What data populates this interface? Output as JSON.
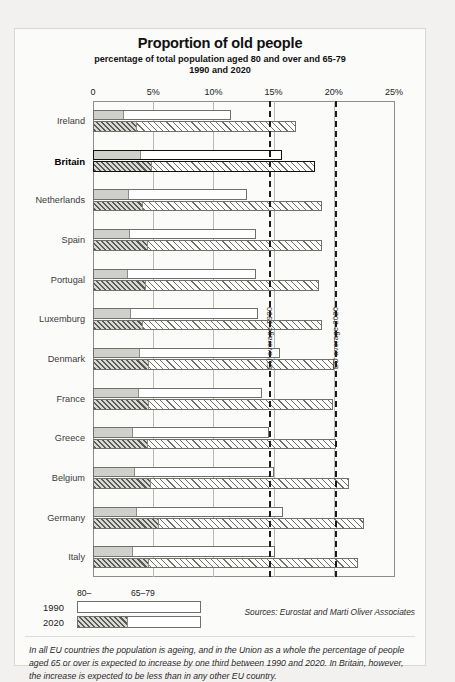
{
  "chart_data": {
    "type": "bar",
    "title": "Proportion of old people",
    "subtitle1": "percentage of total population aged 80 and over and 65-79",
    "subtitle2": "1990 and 2020",
    "xlabel": "",
    "ylabel": "",
    "xlim": [
      0,
      25
    ],
    "grid": true,
    "orientation": "horizontal",
    "stacked": true,
    "legend_position": "bottom-left",
    "axis_ticks": [
      "0",
      "5%",
      "10%",
      "15%",
      "20%",
      "25%"
    ],
    "axis_tick_values": [
      0,
      5,
      10,
      15,
      20,
      25
    ],
    "segment_names": [
      "80–",
      "65–79"
    ],
    "series": [
      {
        "name": "1990",
        "style": "solid"
      },
      {
        "name": "2020",
        "style": "hatched"
      }
    ],
    "annotations": [
      {
        "label": "EU average 1990",
        "value": 14.6
      },
      {
        "label": "EU average 2020",
        "value": 20.1
      }
    ],
    "categories": [
      "Ireland",
      "Britain",
      "Netherlands",
      "Spain",
      "Portugal",
      "Luxemburg",
      "Denmark",
      "France",
      "Greece",
      "Belgium",
      "Germany",
      "Italy"
    ],
    "highlight_category": "Britain",
    "rows": [
      {
        "country": "Ireland",
        "y1990_80plus": 2.5,
        "y1990_total": 11.5,
        "y2020_80plus": 3.6,
        "y2020_total": 16.9
      },
      {
        "country": "Britain",
        "y1990_80plus": 3.9,
        "y1990_total": 15.7,
        "y2020_80plus": 4.8,
        "y2020_total": 18.4
      },
      {
        "country": "Netherlands",
        "y1990_80plus": 2.9,
        "y1990_total": 12.8,
        "y2020_80plus": 4.1,
        "y2020_total": 19.0
      },
      {
        "country": "Spain",
        "y1990_80plus": 3.0,
        "y1990_total": 13.5,
        "y2020_80plus": 4.5,
        "y2020_total": 19.0
      },
      {
        "country": "Portugal",
        "y1990_80plus": 2.8,
        "y1990_total": 13.5,
        "y2020_80plus": 4.3,
        "y2020_total": 18.8
      },
      {
        "country": "Luxemburg",
        "y1990_80plus": 3.1,
        "y1990_total": 13.7,
        "y2020_80plus": 4.1,
        "y2020_total": 19.0
      },
      {
        "country": "Denmark",
        "y1990_80plus": 3.8,
        "y1990_total": 15.5,
        "y2020_80plus": 4.6,
        "y2020_total": 20.0
      },
      {
        "country": "France",
        "y1990_80plus": 3.7,
        "y1990_total": 14.0,
        "y2020_80plus": 4.6,
        "y2020_total": 19.9
      },
      {
        "country": "Greece",
        "y1990_80plus": 3.2,
        "y1990_total": 14.6,
        "y2020_80plus": 4.5,
        "y2020_total": 20.2
      },
      {
        "country": "Belgium",
        "y1990_80plus": 3.4,
        "y1990_total": 15.0,
        "y2020_80plus": 4.7,
        "y2020_total": 21.3
      },
      {
        "country": "Germany",
        "y1990_80plus": 3.6,
        "y1990_total": 15.8,
        "y2020_80plus": 5.4,
        "y2020_total": 22.5
      },
      {
        "country": "Italy",
        "y1990_80plus": 3.2,
        "y1990_total": 15.1,
        "y2020_80plus": 4.6,
        "y2020_total": 22.0
      }
    ]
  },
  "legend": {
    "seg_80_label": "80–",
    "seg_6579_label": "65–79",
    "year_1990": "1990",
    "year_2020": "2020"
  },
  "sources": "Sources: Eurostat and Marti Oliver Associates",
  "footnote": "In all EU countries the population is ageing, and in the Union  as a whole the percentage of people aged 65 or over is expected to increase by one third between 1990 and 2020. In Britain, however, the increase is expected to be less than in any other EU country."
}
